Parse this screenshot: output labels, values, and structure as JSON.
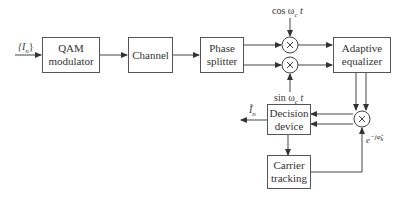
{
  "diagram": {
    "input_label": "{I",
    "input_sub": "n",
    "input_close": "}",
    "blocks": {
      "qam": {
        "line1": "QAM",
        "line2": "modulator"
      },
      "channel": {
        "line1": "Channel"
      },
      "phase_splitter": {
        "line1": "Phase",
        "line2": "splitter"
      },
      "adaptive_equalizer": {
        "line1": "Adaptive",
        "line2": "equalizer"
      },
      "decision_device": {
        "line1": "Decision",
        "line2": "device"
      },
      "carrier_tracking": {
        "line1": "Carrier",
        "line2": "tracking"
      }
    },
    "cos_label": "cos ω",
    "cos_sub": "c",
    "cos_t": " t",
    "sin_label": "sin ω",
    "sin_sub": "c",
    "sin_t": " t",
    "output_label": "Ĩ",
    "output_sub": "n",
    "phase_correction_label": "e",
    "phase_correction_sup": "−jφ̂",
    "phase_correction_sup_sub": "k",
    "multiplier_symbol": "×"
  }
}
